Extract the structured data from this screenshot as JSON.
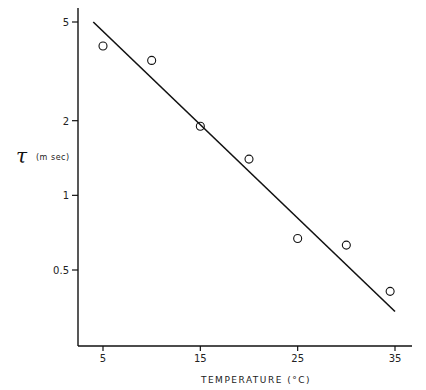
{
  "chart_data": {
    "type": "scatter",
    "title": "",
    "xlabel": "TEMPERATURE (°C)",
    "ylabel": "τ (m sec)",
    "ylabel_symbol": "τ",
    "ylabel_unit": "(m sec)",
    "yscale": "log",
    "xlim": [
      -2.5,
      37
    ],
    "ylim": [
      0.25,
      5.6
    ],
    "xticks": [
      5,
      15,
      25,
      35
    ],
    "xtick_labels": [
      "5",
      "15",
      "25",
      "35"
    ],
    "yticks": [
      5,
      2,
      1,
      0.5
    ],
    "ytick_labels": [
      "5",
      "2",
      "1",
      "0.5"
    ],
    "grid": false,
    "legend": null,
    "series": [
      {
        "name": "measured",
        "marker": "open-circle",
        "x": [
          5,
          10,
          15,
          20,
          25,
          30,
          34.5
        ],
        "y": [
          4.0,
          3.5,
          1.9,
          1.4,
          0.67,
          0.63,
          0.41
        ]
      },
      {
        "name": "fit",
        "style": "line",
        "x": [
          4,
          35
        ],
        "y": [
          5.0,
          0.34
        ]
      }
    ]
  }
}
